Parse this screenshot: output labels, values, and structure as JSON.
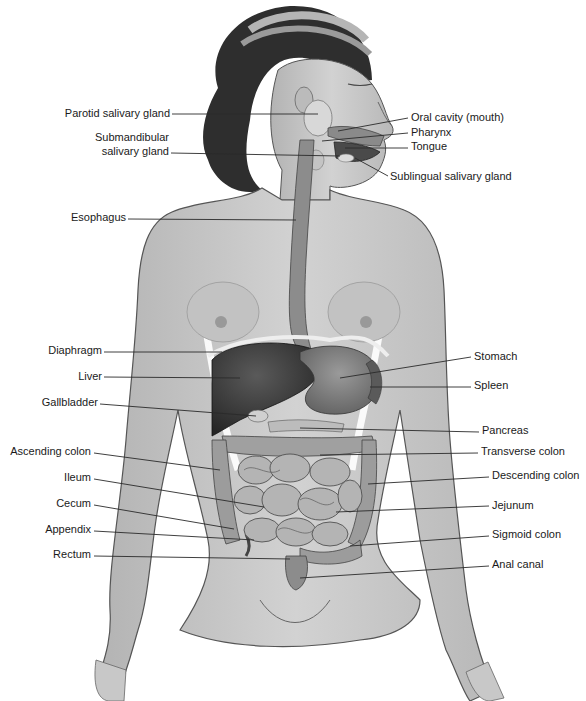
{
  "diagram": {
    "labels_left": [
      {
        "id": "parotid",
        "text": "Parotid salivary gland",
        "x": 170,
        "y": 114
      },
      {
        "id": "submandibular1",
        "text": "Submandibular",
        "x": 169,
        "y": 138
      },
      {
        "id": "submandibular2",
        "text": "salivary gland",
        "x": 169,
        "y": 152
      },
      {
        "id": "esophagus",
        "text": "Esophagus",
        "x": 126,
        "y": 218
      },
      {
        "id": "diaphragm",
        "text": "Diaphragm",
        "x": 102,
        "y": 351
      },
      {
        "id": "liver",
        "text": "Liver",
        "x": 102,
        "y": 377
      },
      {
        "id": "gallbladder",
        "text": "Gallbladder",
        "x": 98,
        "y": 403
      },
      {
        "id": "ascending_colon",
        "text": "Ascending colon",
        "x": 91,
        "y": 452
      },
      {
        "id": "ileum",
        "text": "Ileum",
        "x": 91,
        "y": 478
      },
      {
        "id": "cecum",
        "text": "Cecum",
        "x": 91,
        "y": 504
      },
      {
        "id": "appendix",
        "text": "Appendix",
        "x": 91,
        "y": 530
      },
      {
        "id": "rectum",
        "text": "Rectum",
        "x": 91,
        "y": 555
      }
    ],
    "labels_right": [
      {
        "id": "oral_cavity",
        "text": "Oral cavity (mouth)",
        "x": 411,
        "y": 118
      },
      {
        "id": "pharynx",
        "text": "Pharynx",
        "x": 411,
        "y": 133
      },
      {
        "id": "tongue",
        "text": "Tongue",
        "x": 411,
        "y": 147
      },
      {
        "id": "sublingual",
        "text": "Sublingual salivary gland",
        "x": 390,
        "y": 177
      },
      {
        "id": "stomach",
        "text": "Stomach",
        "x": 474,
        "y": 357
      },
      {
        "id": "spleen",
        "text": "Spleen",
        "x": 474,
        "y": 386
      },
      {
        "id": "pancreas",
        "text": "Pancreas",
        "x": 482,
        "y": 431
      },
      {
        "id": "transverse_colon",
        "text": "Transverse colon",
        "x": 481,
        "y": 452
      },
      {
        "id": "descending_colon",
        "text": "Descending colon",
        "x": 492,
        "y": 476
      },
      {
        "id": "jejunum",
        "text": "Jejunum",
        "x": 492,
        "y": 506
      },
      {
        "id": "sigmoid_colon",
        "text": "Sigmoid colon",
        "x": 492,
        "y": 535
      },
      {
        "id": "anal_canal",
        "text": "Anal canal",
        "x": 492,
        "y": 565
      }
    ],
    "leader_lines": [
      {
        "id": "parotid",
        "x1": 172,
        "y1": 114,
        "x2": 318,
        "y2": 114
      },
      {
        "id": "submandibular",
        "x1": 171,
        "y1": 153,
        "x2": 340,
        "y2": 156
      },
      {
        "id": "esophagus",
        "x1": 128,
        "y1": 219,
        "x2": 296,
        "y2": 220
      },
      {
        "id": "oral_cavity",
        "x1": 408,
        "y1": 118,
        "x2": 338,
        "y2": 131
      },
      {
        "id": "pharynx",
        "x1": 408,
        "y1": 133,
        "x2": 322,
        "y2": 141
      },
      {
        "id": "tongue",
        "x1": 408,
        "y1": 148,
        "x2": 345,
        "y2": 148
      },
      {
        "id": "sublingual",
        "x1": 388,
        "y1": 176,
        "x2": 355,
        "y2": 158
      },
      {
        "id": "diaphragm",
        "x1": 104,
        "y1": 352,
        "x2": 222,
        "y2": 352
      },
      {
        "id": "liver",
        "x1": 104,
        "y1": 377,
        "x2": 240,
        "y2": 378
      },
      {
        "id": "gallbladder",
        "x1": 100,
        "y1": 404,
        "x2": 256,
        "y2": 416
      },
      {
        "id": "ascending_colon",
        "x1": 94,
        "y1": 453,
        "x2": 220,
        "y2": 470
      },
      {
        "id": "ileum",
        "x1": 94,
        "y1": 479,
        "x2": 264,
        "y2": 507
      },
      {
        "id": "cecum",
        "x1": 94,
        "y1": 505,
        "x2": 234,
        "y2": 529
      },
      {
        "id": "appendix",
        "x1": 94,
        "y1": 531,
        "x2": 254,
        "y2": 540
      },
      {
        "id": "rectum",
        "x1": 94,
        "y1": 556,
        "x2": 290,
        "y2": 559
      },
      {
        "id": "stomach",
        "x1": 471,
        "y1": 357,
        "x2": 340,
        "y2": 378
      },
      {
        "id": "spleen",
        "x1": 471,
        "y1": 387,
        "x2": 370,
        "y2": 387
      },
      {
        "id": "pancreas",
        "x1": 479,
        "y1": 432,
        "x2": 300,
        "y2": 428
      },
      {
        "id": "transverse_colon",
        "x1": 478,
        "y1": 453,
        "x2": 320,
        "y2": 455
      },
      {
        "id": "descending_colon",
        "x1": 489,
        "y1": 477,
        "x2": 368,
        "y2": 484
      },
      {
        "id": "jejunum",
        "x1": 489,
        "y1": 506,
        "x2": 336,
        "y2": 512
      },
      {
        "id": "sigmoid_colon",
        "x1": 489,
        "y1": 536,
        "x2": 350,
        "y2": 546
      },
      {
        "id": "anal_canal",
        "x1": 489,
        "y1": 566,
        "x2": 300,
        "y2": 578
      }
    ],
    "colors": {
      "skin": "#c9c9c9",
      "skin_shadow": "#a8a8a8",
      "hair": "#2e2e2e",
      "liver": "#3a3a3a",
      "organ": "#7a7a7a",
      "intestine": "#9a9a9a",
      "line": "#2a2a2a",
      "background": "#ffffff"
    }
  }
}
